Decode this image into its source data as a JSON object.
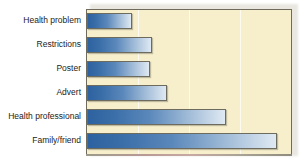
{
  "chart_data": {
    "type": "bar",
    "orientation": "horizontal",
    "title": "",
    "subtitle": "",
    "xlabel": "",
    "ylabel": "",
    "categories": [
      "Health problem",
      "Restrictions",
      "Poster",
      "Advert",
      "Health professional",
      "Family/friend"
    ],
    "values": [
      22,
      32,
      31,
      39,
      68,
      93
    ],
    "xlim": [
      0,
      100
    ],
    "ylim": null,
    "grid": true,
    "gridlines_x": [
      25,
      50,
      75
    ],
    "legend": null,
    "legend_position": "none",
    "annotations": [],
    "series": [
      {
        "name": "Source of information",
        "values": [
          22,
          32,
          31,
          39,
          68,
          93
        ]
      }
    ]
  },
  "style": {
    "plot_background": "#f7eecb",
    "bar_gradient_start": "#2d62a0",
    "bar_gradient_end": "#dfe9f3",
    "bar_border": "#6d6a5e",
    "gridline_color": "#fdfaf0",
    "panel_border": "#6e6a5c",
    "label_color": "#1b1b1b",
    "page_background": "#ffffff"
  },
  "geometry": {
    "plot_left_px": 86,
    "plot_top_px": 9,
    "plot_width_px": 206,
    "plot_height_px": 146,
    "bar_height_px": 16,
    "bar_tops_px": [
      12,
      36,
      60,
      84,
      108,
      132
    ],
    "bar_widths_px": [
      44,
      64,
      62,
      78,
      136,
      186
    ],
    "gridline_x_px": [
      52,
      103,
      155
    ],
    "label_tops_px": [
      14,
      38,
      62,
      86,
      110,
      134
    ]
  }
}
